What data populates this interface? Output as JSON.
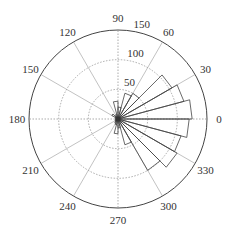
{
  "chart_data": {
    "type": "polar-histogram",
    "title": "",
    "center": [
      118,
      119
    ],
    "outer_radius_px": 89,
    "r_max": 150,
    "radial_ticks": [
      50,
      100,
      150
    ],
    "radial_tick_labels": [
      "50",
      "100",
      "150"
    ],
    "angle_ticks": [
      0,
      30,
      60,
      90,
      120,
      150,
      180,
      210,
      240,
      270,
      300,
      330
    ],
    "angle_tick_labels": [
      "0",
      "30",
      "60",
      "90",
      "120",
      "150",
      "180",
      "210",
      "240",
      "270",
      "300",
      "330"
    ],
    "bin_width_deg": 15,
    "bins": [
      {
        "start": 0,
        "end": 15,
        "value": 125
      },
      {
        "start": 15,
        "end": 30,
        "value": 115
      },
      {
        "start": 30,
        "end": 45,
        "value": 105
      },
      {
        "start": 45,
        "end": 60,
        "value": 50
      },
      {
        "start": 60,
        "end": 75,
        "value": 45
      },
      {
        "start": 75,
        "end": 90,
        "value": 20
      },
      {
        "start": 90,
        "end": 105,
        "value": 30
      },
      {
        "start": 105,
        "end": 120,
        "value": 8
      },
      {
        "start": 120,
        "end": 135,
        "value": 6
      },
      {
        "start": 135,
        "end": 150,
        "value": 12
      },
      {
        "start": 150,
        "end": 165,
        "value": 5
      },
      {
        "start": 165,
        "end": 180,
        "value": 4
      },
      {
        "start": 180,
        "end": 195,
        "value": 4
      },
      {
        "start": 195,
        "end": 210,
        "value": 5
      },
      {
        "start": 210,
        "end": 225,
        "value": 6
      },
      {
        "start": 225,
        "end": 240,
        "value": 8
      },
      {
        "start": 240,
        "end": 255,
        "value": 10
      },
      {
        "start": 255,
        "end": 270,
        "value": 25
      },
      {
        "start": 270,
        "end": 285,
        "value": 15
      },
      {
        "start": 285,
        "end": 300,
        "value": 45
      },
      {
        "start": 300,
        "end": 315,
        "value": 100
      },
      {
        "start": 315,
        "end": 330,
        "value": 115
      },
      {
        "start": 330,
        "end": 345,
        "value": 110
      },
      {
        "start": 345,
        "end": 360,
        "value": 120
      }
    ],
    "grid": true,
    "legend": null
  }
}
